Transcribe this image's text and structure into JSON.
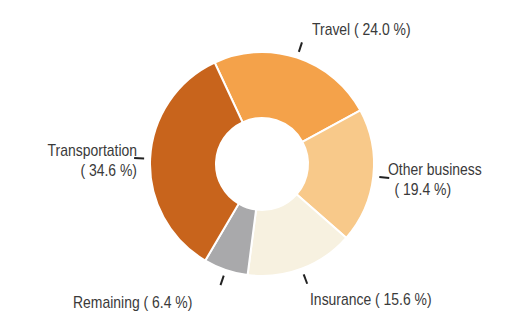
{
  "chart_data": {
    "type": "pie",
    "variant": "donut",
    "title": "",
    "categories": [
      "Travel",
      "Other business",
      "Insurance",
      "Remaining",
      "Transportation"
    ],
    "values": [
      24.0,
      19.4,
      15.6,
      6.4,
      34.6
    ],
    "unit": "%",
    "colors": [
      "#f4a24a",
      "#f8c98a",
      "#f7f1e0",
      "#a9a9ab",
      "#c8641c"
    ],
    "labels": [
      {
        "line1": "Travel ( 24.0 %)",
        "line2": ""
      },
      {
        "line1": "Other business",
        "line2": "( 19.4 %)"
      },
      {
        "line1": "Insurance ( 15.6 %)",
        "line2": ""
      },
      {
        "line1": "Remaining (  6.4 %)",
        "line2": ""
      },
      {
        "line1": "Transportation",
        "line2": "( 34.6 %)"
      }
    ],
    "start_angle_deg": -25,
    "direction": "clockwise",
    "legend": "none (direct labels with leader ticks)"
  }
}
